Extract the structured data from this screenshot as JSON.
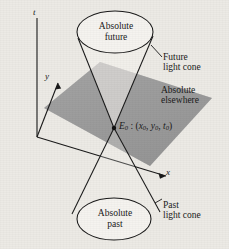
{
  "figure": {
    "kind": "spacetime-light-cone-diagram",
    "background_color": "#eceae5",
    "plane_color": "#9a9a9a",
    "line_color": "#1a1a1a",
    "ellipse_fill": "#f5f3ef"
  },
  "axes": {
    "t_label": "t",
    "y_label": "y",
    "x_label": "x"
  },
  "regions": {
    "future_label_line1": "Absolute",
    "future_label_line2": "future",
    "past_label_line1": "Absolute",
    "past_label_line2": "past",
    "elsewhere_line1": "Absolute",
    "elsewhere_line2": "elsewhere"
  },
  "cones": {
    "future_cone_line1": "Future",
    "future_cone_line2": "light cone",
    "past_cone_line1": "Past",
    "past_cone_line2": "light cone"
  },
  "event": {
    "symbol": "E",
    "symbol_sub": "0",
    "separator": " : (",
    "coord1": "x",
    "coord1_sub": "0",
    "comma1": ", ",
    "coord2": "y",
    "coord2_sub": "0",
    "comma2": ", ",
    "coord3": "t",
    "coord3_sub": "0",
    "close": ")"
  }
}
